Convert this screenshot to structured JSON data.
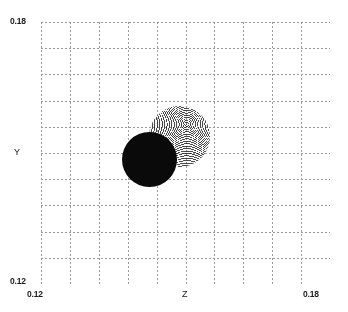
{
  "chart_data": {
    "type": "scatter",
    "title": "",
    "xlabel": "Z",
    "ylabel": "Y",
    "xlim": [
      0.12,
      0.18
    ],
    "ylim": [
      0.12,
      0.18
    ],
    "xticklabels": [
      "0.12",
      "0.18"
    ],
    "yticklabels": [
      "0.12",
      "0.18"
    ],
    "grid": true,
    "grid_style": "dotted",
    "grid_color": "#9a9a9a",
    "grid_divisions_x": 10,
    "grid_divisions_y": 10,
    "legend": "none",
    "background": "#ffffff",
    "series": [
      {
        "name": "cluster-light",
        "marker": "dot",
        "color": "#4a4a4a",
        "density": "moire-textured",
        "shape": "filled-disc",
        "center_x": 0.1487,
        "center_y": 0.1537,
        "radius": 0.0063,
        "point_count_estimate": 20000
      },
      {
        "name": "cluster-dark",
        "marker": "dot",
        "color": "#0a0a0a",
        "density": "saturated",
        "shape": "filled-disc",
        "center_x": 0.1425,
        "center_y": 0.1485,
        "radius": 0.0057,
        "point_count_estimate": 20000
      }
    ]
  },
  "axes": {
    "x": {
      "label": "Z",
      "min_label": "0.12",
      "max_label": "0.18"
    },
    "y": {
      "label": "Y",
      "min_label": "0.12",
      "max_label": "0.18"
    }
  }
}
